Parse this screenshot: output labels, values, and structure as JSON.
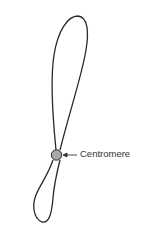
{
  "diagram": {
    "labels": {
      "centromere": "Centromere"
    },
    "colors": {
      "outline": "#2a2a2a",
      "centromere_fill": "#a8a8a8",
      "label_text": "#333333",
      "background": "#ffffff"
    }
  }
}
